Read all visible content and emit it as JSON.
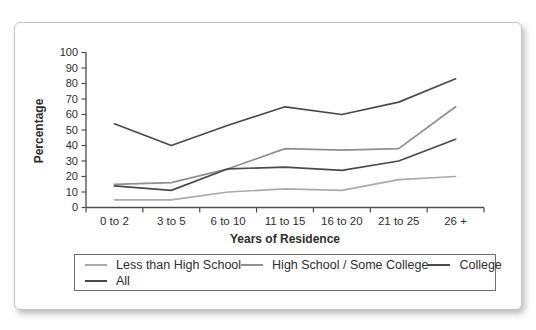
{
  "chart_data": {
    "type": "line",
    "title": "",
    "xlabel": "Years of Residence",
    "ylabel": "Percentage",
    "ylim": [
      0,
      100
    ],
    "yticks": [
      0,
      10,
      20,
      30,
      40,
      50,
      60,
      70,
      80,
      90,
      100
    ],
    "grid": false,
    "legend_position": "bottom",
    "categories": [
      "0 to 2",
      "3 to 5",
      "6 to 10",
      "11 to 15",
      "16 to 20",
      "21 to 25",
      "26 +"
    ],
    "series": [
      {
        "name": "Less than High School",
        "color": "#ababab",
        "values": [
          5,
          5,
          10,
          12,
          11,
          18,
          20
        ]
      },
      {
        "name": "High School / Some College",
        "color": "#8f8f8f",
        "values": [
          15,
          16,
          25,
          38,
          37,
          38,
          65
        ]
      },
      {
        "name": "College",
        "color": "#4a4a4a",
        "values": [
          54,
          40,
          53,
          65,
          60,
          68,
          83
        ]
      },
      {
        "name": "All",
        "color": "#4a4a4a",
        "values": [
          14,
          11,
          25,
          26,
          24,
          30,
          44
        ]
      }
    ],
    "axis_color": "#4d4d4d",
    "tick_label_color": "#2e2e2e"
  }
}
